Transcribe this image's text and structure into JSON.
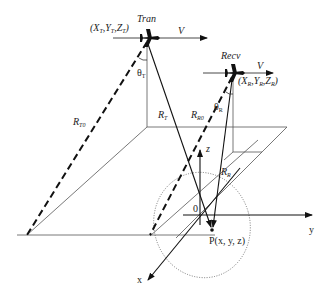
{
  "diagram": {
    "transmitter": {
      "name": "Tran",
      "coords": {
        "prefix": "(X",
        "s1": "T",
        "m1": ",Y",
        "s2": "T",
        "m2": ",Z",
        "s3": "T",
        "suffix": ")"
      },
      "velocity": "V",
      "angle": {
        "symbol": "θ",
        "sub": "T"
      }
    },
    "receiver": {
      "name": "Recv",
      "coords": {
        "prefix": "(X",
        "s1": "R",
        "m1": ",Y",
        "s2": "R",
        "m2": ",Z",
        "s3": "R",
        "suffix": ")"
      },
      "velocity": "V",
      "angle": {
        "symbol": "θ",
        "sub": "R"
      }
    },
    "ranges": {
      "RT0": {
        "main": "R",
        "sub": "T0"
      },
      "RT": {
        "main": "R",
        "sub": "T"
      },
      "RR0": {
        "main": "R",
        "sub": "R0"
      },
      "RR": {
        "main": "R",
        "sub": "R"
      }
    },
    "axes": {
      "x": "x",
      "y": "y",
      "z": "z",
      "origin": "0"
    },
    "target": {
      "label": "P(x, y, z)"
    }
  }
}
